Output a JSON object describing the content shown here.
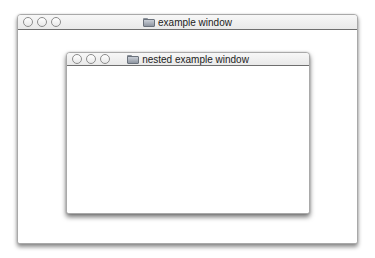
{
  "outer_window": {
    "title": "example window",
    "title_icon": "folder-icon",
    "buttons": [
      "close",
      "minimize",
      "zoom"
    ]
  },
  "inner_window": {
    "title": "nested example window",
    "title_icon": "folder-icon",
    "buttons": [
      "close",
      "minimize",
      "zoom"
    ]
  },
  "colors": {
    "background": "#ffffff",
    "window_border": "#a9a9a9",
    "titlebar_top": "#f7f7f7",
    "titlebar_bottom": "#e9e9e9",
    "titlebar_divider": "#6e6e6e",
    "title_text": "#222222"
  }
}
